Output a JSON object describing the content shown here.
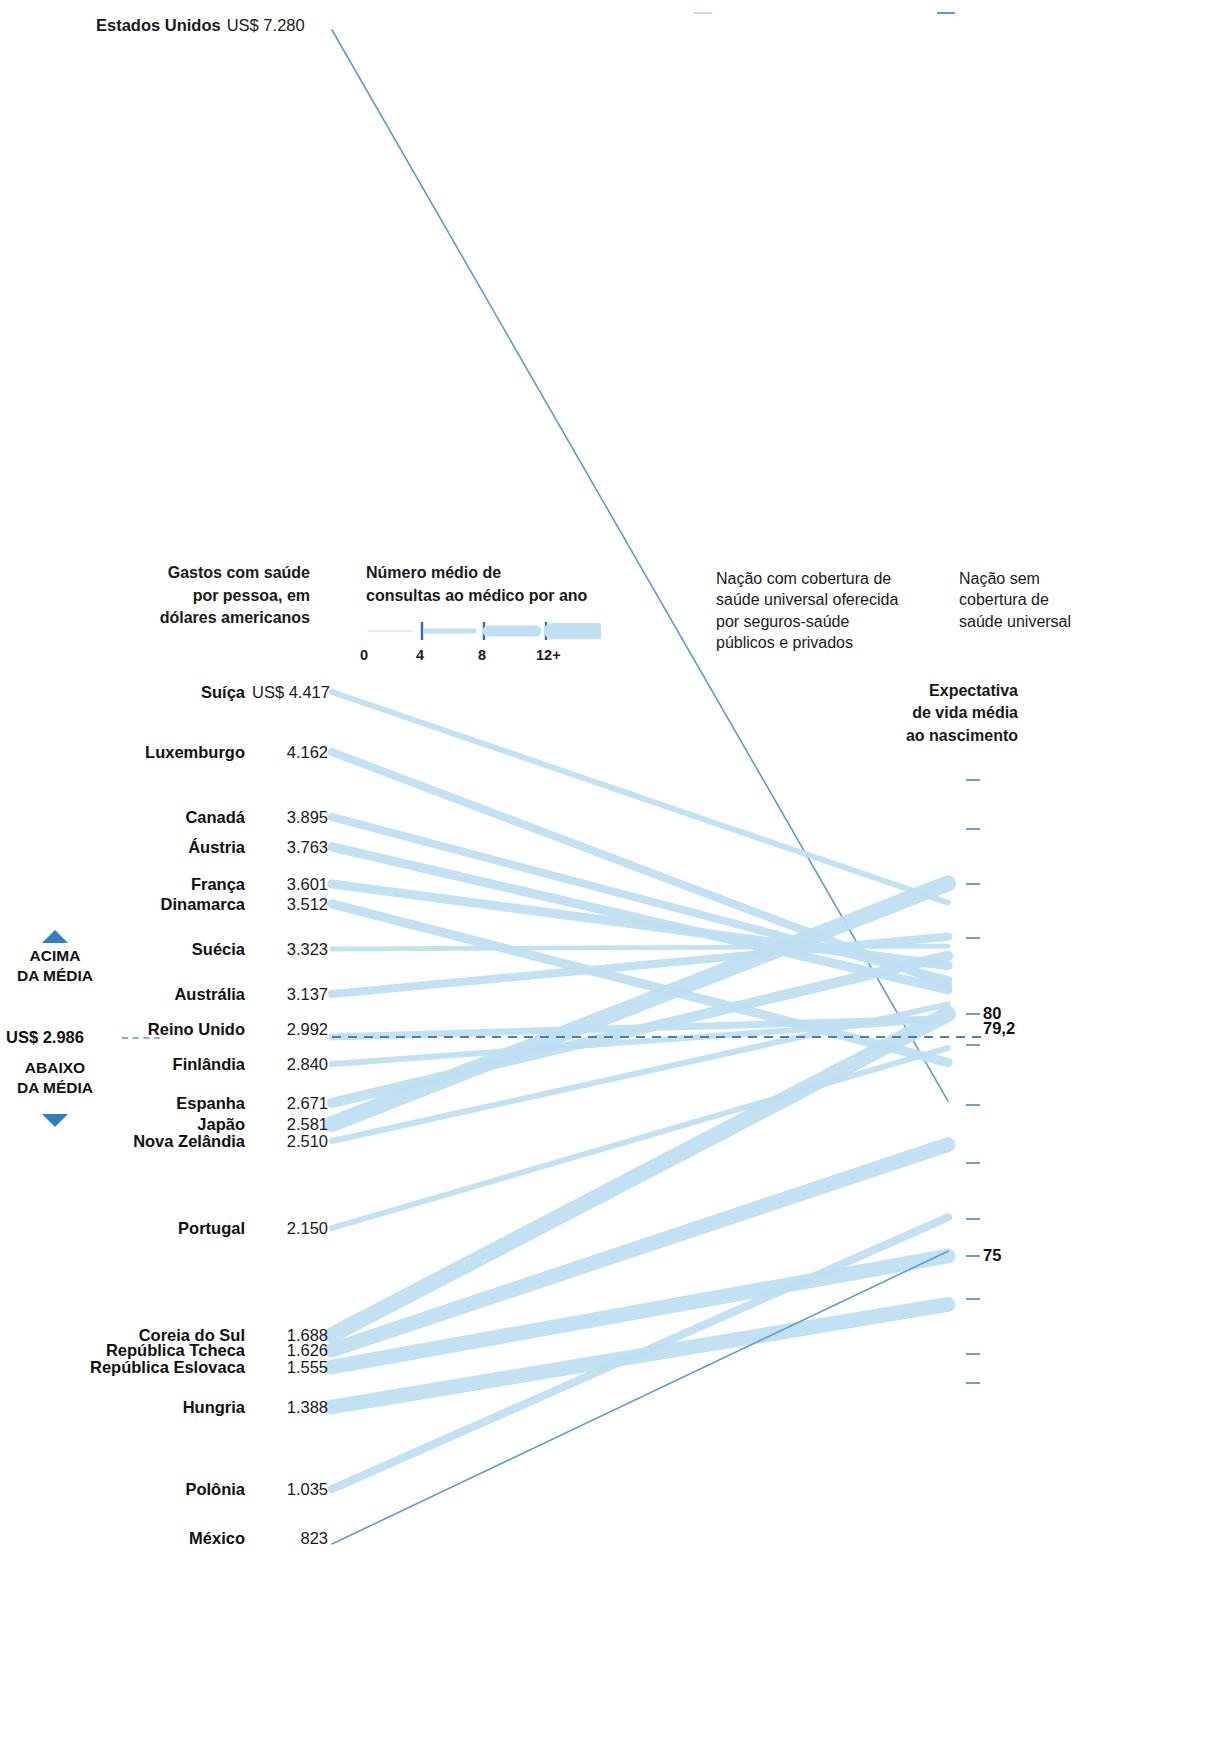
{
  "chart_data": {
    "type": "line",
    "left_axis_label": "Gastos com saúde por pessoa, em dólares americanos",
    "right_axis_label": "Expectativa de vida média ao nascimento",
    "left_units": "US$",
    "right_units": "anos",
    "left_axis_range": [
      823,
      7280
    ],
    "right_axis_range": [
      74.0,
      83.0
    ],
    "right_ticks": [
      "",
      "",
      "",
      "",
      "80",
      "79,2",
      "",
      "",
      "",
      "",
      "75",
      "",
      ""
    ],
    "grid": false,
    "legend_position": "top-right",
    "average_spending": 2986,
    "average_life_expectancy": 79.2,
    "encodings": {
      "line_width": "Número médio de consultas ao médico por ano",
      "line_width_scale": [
        0,
        4,
        8,
        "12+"
      ],
      "line_color": {
        "universal": "#bfe0f2",
        "non_universal": "#5a9bd4"
      }
    },
    "series": [
      {
        "name": "Estados Unidos",
        "value_label": "US$ 7.280",
        "spending": 7280,
        "life": 78.2,
        "visits": 4,
        "universal": false
      },
      {
        "name": "Suíça",
        "value_label": "US$ 4.417",
        "spending": 4417,
        "life": 82.3,
        "visits": 4,
        "universal": true
      },
      {
        "name": "Luxemburgo",
        "value_label": "4.162",
        "spending": 4162,
        "life": 80.6,
        "visits": 6,
        "universal": true
      },
      {
        "name": "Canadá",
        "value_label": "3.895",
        "spending": 3895,
        "life": 80.7,
        "visits": 6,
        "universal": true
      },
      {
        "name": "Áustria",
        "value_label": "3.763",
        "spending": 3763,
        "life": 80.5,
        "visits": 7,
        "universal": true
      },
      {
        "name": "França",
        "value_label": "3.601",
        "spending": 3601,
        "life": 81.0,
        "visits": 7,
        "universal": true
      },
      {
        "name": "Dinamarca",
        "value_label": "3.512",
        "spending": 3512,
        "life": 79.0,
        "visits": 7,
        "universal": true
      },
      {
        "name": "Suécia",
        "value_label": "3.323",
        "spending": 3323,
        "life": 81.4,
        "visits": 3,
        "universal": true
      },
      {
        "name": "Austrália",
        "value_label": "3.137",
        "spending": 3137,
        "life": 81.6,
        "visits": 6,
        "universal": true
      },
      {
        "name": "Reino Unido",
        "value_label": "2.992",
        "spending": 2992,
        "life": 79.9,
        "visits": 5,
        "universal": true
      },
      {
        "name": "Finlândia",
        "value_label": "2.840",
        "spending": 2840,
        "life": 79.9,
        "visits": 4,
        "universal": true
      },
      {
        "name": "Espanha",
        "value_label": "2.671",
        "spending": 2671,
        "life": 81.2,
        "visits": 8,
        "universal": true
      },
      {
        "name": "Japão",
        "value_label": "2.581",
        "spending": 2581,
        "life": 82.7,
        "visits": 13,
        "universal": true
      },
      {
        "name": "Nova Zelândia",
        "value_label": "2.510",
        "spending": 2510,
        "life": 80.2,
        "visits": 4,
        "universal": true
      },
      {
        "name": "Portugal",
        "value_label": "2.150",
        "spending": 2150,
        "life": 79.3,
        "visits": 4,
        "universal": true
      },
      {
        "name": "Coreia do Sul",
        "value_label": "1.688",
        "spending": 1688,
        "life": 80.0,
        "visits": 13,
        "universal": true
      },
      {
        "name": "República Tcheca",
        "value_label": "1.626",
        "spending": 1626,
        "life": 77.3,
        "visits": 12,
        "universal": true
      },
      {
        "name": "República Eslovaca",
        "value_label": "1.555",
        "spending": 1555,
        "life": 75.0,
        "visits": 12,
        "universal": true
      },
      {
        "name": "Hungria",
        "value_label": "1.388",
        "spending": 1388,
        "life": 74.0,
        "visits": 12,
        "universal": true
      },
      {
        "name": "Polônia",
        "value_label": "1.035",
        "spending": 1035,
        "life": 75.8,
        "visits": 6,
        "universal": true
      },
      {
        "name": "México",
        "value_label": "823",
        "spending": 823,
        "life": 75.1,
        "visits": 2,
        "universal": false
      }
    ]
  },
  "top_label": {
    "country": "Estados Unidos",
    "value": "US$ 7.280"
  },
  "legend": {
    "spending_title_lines": [
      "Gastos com saúde",
      "por pessoa, em",
      "dólares americanos"
    ],
    "visits_title_lines": [
      "Número médio de",
      "consultas ao médico por ano"
    ],
    "visits_ticks": [
      "0",
      "4",
      "8",
      "12+"
    ],
    "universal_lines": [
      "Nação com cobertura de",
      "saúde universal oferecida",
      "por seguros-saúde",
      "públicos e privados"
    ],
    "non_universal_lines": [
      "Nação sem",
      "cobertura de",
      "saúde universal"
    ]
  },
  "right_axis": {
    "title_lines": [
      "Expectativa",
      "de vida média",
      "ao nascimento"
    ],
    "labeled_ticks": [
      {
        "text": "80",
        "top": 1014
      },
      {
        "text": "79,2",
        "top": 1029
      },
      {
        "text": "75",
        "top": 1256
      }
    ]
  },
  "average_marker": {
    "above_line1": "ACIMA",
    "above_line2": "DA MÉDIA",
    "below_line1": "ABAIXO",
    "below_line2": "DA MÉDIA",
    "value": "US$ 2.986"
  },
  "rows": [
    {
      "name": "Suíça",
      "value": "US$ 4.417",
      "top": 692
    },
    {
      "name": "Luxemburgo",
      "value": "4.162",
      "top": 752
    },
    {
      "name": "Canadá",
      "value": "3.895",
      "top": 817
    },
    {
      "name": "Áustria",
      "value": "3.763",
      "top": 847
    },
    {
      "name": "França",
      "value": "3.601",
      "top": 884
    },
    {
      "name": "Dinamarca",
      "value": "3.512",
      "top": 904
    },
    {
      "name": "Suécia",
      "value": "3.323",
      "top": 949
    },
    {
      "name": "Austrália",
      "value": "3.137",
      "top": 994
    },
    {
      "name": "Reino Unido",
      "value": "2.992",
      "top": 1029
    },
    {
      "name": "Finlândia",
      "value": "2.840",
      "top": 1064
    },
    {
      "name": "Espanha",
      "value": "2.671",
      "top": 1103
    },
    {
      "name": "Japão",
      "value": "2.581",
      "top": 1124
    },
    {
      "name": "Nova Zelândia",
      "value": "2.510",
      "top": 1141
    },
    {
      "name": "Portugal",
      "value": "2.150",
      "top": 1228
    },
    {
      "name": "Coreia do Sul",
      "value": "1.688",
      "top": 1335
    },
    {
      "name": "República Tcheca",
      "value": "1.626",
      "top": 1350
    },
    {
      "name": "República Eslovaca",
      "value": "1.555",
      "top": 1367
    },
    {
      "name": "Hungria",
      "value": "1.388",
      "top": 1407
    },
    {
      "name": "Polônia",
      "value": "1.035",
      "top": 1489
    },
    {
      "name": "México",
      "value": "823",
      "top": 1538
    }
  ],
  "colors": {
    "universal_line": "#bfe0f2",
    "non_universal_line": "#5a9bd4",
    "average_dash": "#4a7fb5",
    "triangle": "#2f7fc1",
    "axis_tick": "#6f9fc8",
    "text": "#111111"
  }
}
